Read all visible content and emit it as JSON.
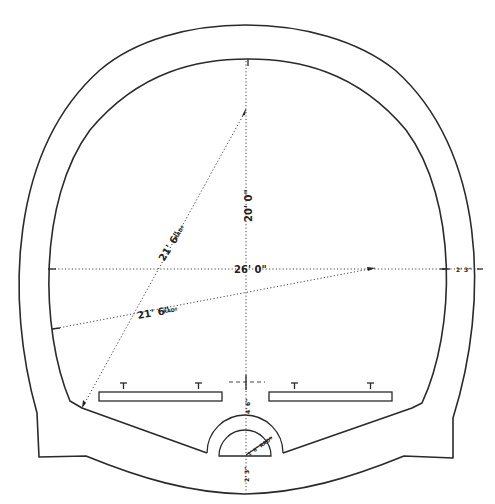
{
  "diagram": {
    "dimensions": {
      "height_label": "20' 0\"",
      "width_label": "26' 0\"",
      "wall_thickness_label": "2' 3\"",
      "upper_radius_label": "21' 6\"",
      "upper_radius_suffix": "RADº",
      "lower_radius_label": "21' 6\"",
      "lower_radius_suffix": "RADº",
      "platform_to_drain_label": "4' 6\"",
      "drain_radius_label": "1' 6\" RADº",
      "invert_thickness_label": "2' 3\""
    },
    "colors": {
      "line": "#2a2a2a",
      "background": "#ffffff"
    }
  }
}
